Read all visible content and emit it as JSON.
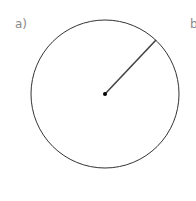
{
  "labels": {
    "a": "a)",
    "b": "b"
  },
  "diagram": {
    "type": "circle-with-radius",
    "circle": {
      "cx": 105,
      "cy": 94,
      "r": 74,
      "stroke": "#333333"
    },
    "radius_line": {
      "x1": 105,
      "y1": 94,
      "x2": 156,
      "y2": 40,
      "stroke": "#444444"
    },
    "center_point": {
      "cx": 105,
      "cy": 94,
      "r": 2,
      "fill": "#000000"
    }
  }
}
